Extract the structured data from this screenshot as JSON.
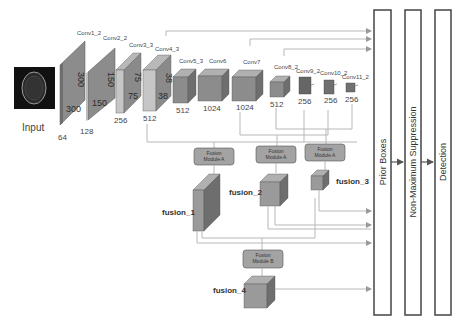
{
  "input": {
    "label": "Input",
    "channels": "64"
  },
  "layers": [
    {
      "name": "Conv1_2",
      "size_a": "300",
      "size_b": "300",
      "channels": "64"
    },
    {
      "name": "Conv2_2",
      "size_a": "150",
      "size_b": "150",
      "channels": "128"
    },
    {
      "name": "Conv3_3",
      "size_a": "75",
      "size_b": "75",
      "channels": "256"
    },
    {
      "name": "Conv4_3",
      "size_a": "38",
      "size_b": "38",
      "channels": "512"
    },
    {
      "name": "Conv5_3",
      "size_a": "19",
      "size_b": "19",
      "channels": "512"
    },
    {
      "name": "Conv6",
      "size_a": "19",
      "size_b": "19",
      "channels": "1024"
    },
    {
      "name": "Conv7",
      "size_a": "19",
      "size_b": "19",
      "channels": "1024"
    },
    {
      "name": "Conv8_2",
      "size_a": "10",
      "size_b": "10",
      "channels": "512"
    },
    {
      "name": "Conv9_2",
      "size_a": "5",
      "size_b": "5",
      "channels": "256"
    },
    {
      "name": "Conv10_2",
      "size_a": "3",
      "size_b": "3",
      "channels": "256"
    },
    {
      "name": "Conv11_2",
      "size_a": "1",
      "size_b": "1",
      "channels": "256"
    }
  ],
  "modules": {
    "fusion_a_1": {
      "line1": "Fusion",
      "line2": "Module A"
    },
    "fusion_a_2": {
      "line1": "Fusion",
      "line2": "Module A"
    },
    "fusion_a_3": {
      "line1": "Fusion",
      "line2": "Module A"
    },
    "fusion_b": {
      "line1": "Fusion",
      "line2": "Module B"
    }
  },
  "fusions": {
    "f1": "fusion_1",
    "f2": "fusion_2",
    "f3": "fusion_3",
    "f4": "fusion_4"
  },
  "stages": {
    "prior": "Prior Boxes",
    "nms": "Non-Maximum Suppression",
    "detection": "Detection"
  },
  "colors": {
    "block_front": "#8c8c8c",
    "block_side": "#6e6e6e",
    "block_top": "#b0b0b0",
    "light_front": "#c4c4c4",
    "module_fill": "#a3a3a3",
    "line": "#b8b8b8",
    "stage_border": "#444444"
  }
}
